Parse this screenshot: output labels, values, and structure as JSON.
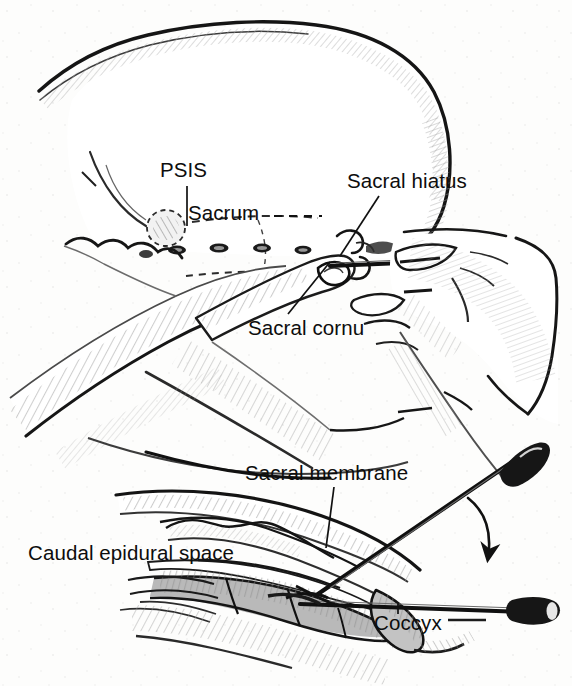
{
  "figure": {
    "kind": "medical-line-drawing",
    "background_color": "#fdfdfc",
    "ink_color": "#111111",
    "panels": [
      {
        "name": "surface-anatomy-panel",
        "description": "Surface view of buttock and sacrum with clinician's hands placing a needle at the sacral hiatus"
      },
      {
        "name": "sagittal-section-panel",
        "description": "Sagittal cross-section of sacrum showing needle passing through the sacral membrane into the caudal epidural space, with a second needle position and a rotation arrow"
      }
    ]
  },
  "labels": {
    "psis": "PSIS",
    "sacrum": "Sacrum",
    "sacral_hiatus": "Sacral hiatus",
    "sacral_cornu": "Sacral cornu",
    "sacral_membrane": "Sacral membrane",
    "caudal_epidural_space": "Caudal epidural space",
    "coccyx": "Coccyx"
  },
  "leaders": [
    {
      "name": "psis-leader",
      "style": "solid-vertical"
    },
    {
      "name": "sacrum-leader",
      "style": "dashed-horizontal"
    },
    {
      "name": "sacral-hiatus-leader",
      "style": "solid-diagonal"
    },
    {
      "name": "sacral-cornu-leader",
      "style": "solid-diagonal"
    },
    {
      "name": "sacral-membrane-leader",
      "style": "solid-vertical"
    },
    {
      "name": "coccyx-leader",
      "style": "solid-vertical"
    }
  ],
  "annotations": {
    "rotation_arrow": "curved arrow showing needle being rotated downward to the flatter insertion angle"
  },
  "colors": {
    "ink": "#111111",
    "mid_tone": "#7f7f7f",
    "light_tone": "#bdbdbd",
    "paper": "#fdfdfc"
  }
}
